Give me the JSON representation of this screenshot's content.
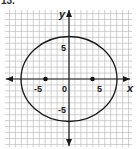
{
  "problem": {
    "number": "13."
  },
  "chart_data": {
    "type": "ellipse-graph",
    "title": "",
    "xlabel": "x",
    "ylabel": "y",
    "x_tick_labels": [
      "-5",
      "0",
      "5"
    ],
    "y_tick_labels": [
      "5",
      "-5"
    ],
    "xlim": [
      -11,
      11
    ],
    "ylim": [
      -11,
      12
    ],
    "grid": true,
    "ellipse": {
      "center": [
        0,
        0
      ],
      "semi_axis_x": 8,
      "semi_axis_y": 7
    },
    "points": [
      {
        "x": -3.87,
        "y": 0,
        "label": "focus"
      },
      {
        "x": 3.87,
        "y": 0,
        "label": "focus"
      }
    ],
    "colors": {
      "grid": "#b8b8b8",
      "curve": "#1a1a1a",
      "axis": "#1a1a1a"
    }
  },
  "labels": {
    "x_axis": "x",
    "y_axis": "y",
    "x_neg5": "-5",
    "x_zero": "0",
    "x_pos5": "5",
    "y_pos5": "5",
    "y_neg5": "-5"
  }
}
